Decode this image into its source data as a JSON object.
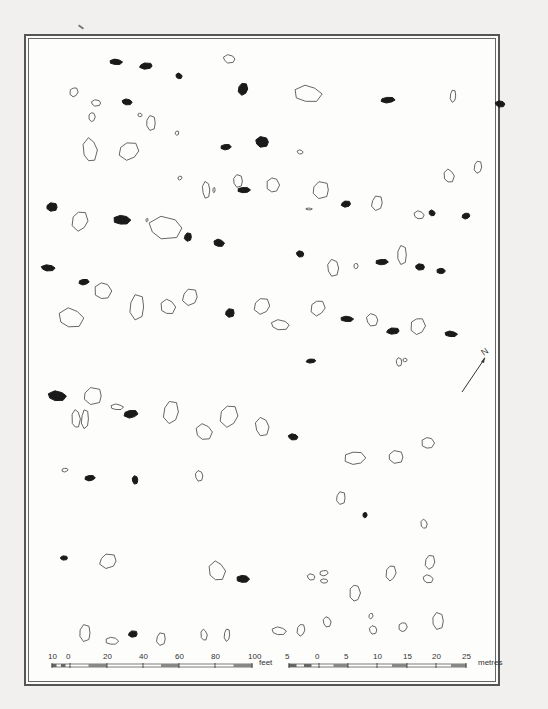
{
  "figure": {
    "type": "archaeological site plan (stone rows)",
    "frame": {
      "x": 24,
      "y": 34,
      "width": 476,
      "height": 652
    },
    "north_arrow": {
      "label": "N",
      "from": [
        462,
        392
      ],
      "to": [
        485,
        358
      ]
    },
    "legend_semantics": {
      "outline-stone": "standing/visible stone (outlined)",
      "filled-stone": "fallen or buried stone (solid black)"
    }
  },
  "scale_feet": {
    "unit_label": "feet",
    "tick_labels": [
      "10",
      "0",
      "20",
      "40",
      "60",
      "80",
      "100"
    ],
    "tick_x": [
      52,
      70,
      107,
      143,
      179,
      215,
      252
    ]
  },
  "scale_metres": {
    "unit_label": "metres",
    "tick_labels": [
      "5",
      "0",
      "5",
      "10",
      "15",
      "20",
      "25"
    ],
    "tick_x": [
      289,
      319,
      348,
      377,
      407,
      436,
      466
    ]
  },
  "colors": {
    "paper": "#fdfdfc",
    "frame": "#555555",
    "ink": "#1a1a1a",
    "outline": "#555555"
  },
  "stones_filled": [
    [
      116,
      62,
      6,
      3
    ],
    [
      146,
      66,
      7,
      3
    ],
    [
      179,
      76,
      3,
      3
    ],
    [
      243,
      89,
      5,
      6
    ],
    [
      127,
      102,
      5,
      3
    ],
    [
      388,
      100,
      7,
      3
    ],
    [
      500,
      104,
      5,
      3
    ],
    [
      226,
      147,
      5,
      3
    ],
    [
      262,
      142,
      7,
      5
    ],
    [
      244,
      190,
      6,
      3
    ],
    [
      52,
      207,
      6,
      4
    ],
    [
      122,
      220,
      8,
      5
    ],
    [
      188,
      237,
      4,
      4
    ],
    [
      219,
      243,
      5,
      4
    ],
    [
      346,
      204,
      5,
      3
    ],
    [
      432,
      213,
      3,
      3
    ],
    [
      466,
      216,
      4,
      3
    ],
    [
      48,
      268,
      7,
      3
    ],
    [
      84,
      282,
      5,
      3
    ],
    [
      300,
      254,
      4,
      3
    ],
    [
      382,
      262,
      6,
      3
    ],
    [
      420,
      267,
      5,
      3
    ],
    [
      441,
      271,
      4,
      3
    ],
    [
      230,
      313,
      5,
      4
    ],
    [
      347,
      319,
      6,
      3
    ],
    [
      393,
      331,
      7,
      3
    ],
    [
      451,
      334,
      6,
      3
    ],
    [
      311,
      361,
      5,
      2
    ],
    [
      57,
      396,
      9,
      5
    ],
    [
      131,
      414,
      7,
      4
    ],
    [
      293,
      437,
      5,
      3
    ],
    [
      90,
      478,
      5,
      3
    ],
    [
      135,
      480,
      3,
      4
    ],
    [
      365,
      515,
      2,
      3
    ],
    [
      64,
      558,
      4,
      2
    ],
    [
      243,
      579,
      6,
      4
    ],
    [
      133,
      634,
      5,
      3
    ]
  ],
  "stones_outline": [
    [
      229,
      59,
      6,
      4
    ],
    [
      74,
      92,
      4,
      5
    ],
    [
      96,
      103,
      5,
      3
    ],
    [
      92,
      117,
      3,
      5
    ],
    [
      151,
      123,
      5,
      7
    ],
    [
      140,
      115,
      2,
      2
    ],
    [
      177,
      133,
      2,
      2
    ],
    [
      308,
      94,
      13,
      9
    ],
    [
      453,
      96,
      3,
      6
    ],
    [
      90,
      150,
      7,
      12
    ],
    [
      129,
      151,
      10,
      9
    ],
    [
      300,
      152,
      3,
      2
    ],
    [
      180,
      178,
      2,
      2
    ],
    [
      206,
      190,
      4,
      8
    ],
    [
      214,
      190,
      1,
      3
    ],
    [
      238,
      181,
      5,
      6
    ],
    [
      273,
      185,
      6,
      8
    ],
    [
      321,
      190,
      9,
      8
    ],
    [
      309,
      209,
      3,
      1
    ],
    [
      377,
      203,
      6,
      7
    ],
    [
      449,
      176,
      5,
      7
    ],
    [
      478,
      167,
      4,
      6
    ],
    [
      419,
      215,
      5,
      4
    ],
    [
      80,
      221,
      8,
      10
    ],
    [
      165,
      228,
      17,
      11
    ],
    [
      147,
      220,
      1,
      2
    ],
    [
      333,
      268,
      6,
      8
    ],
    [
      356,
      266,
      2,
      3
    ],
    [
      402,
      255,
      5,
      9
    ],
    [
      103,
      291,
      8,
      9
    ],
    [
      137,
      307,
      8,
      12
    ],
    [
      168,
      307,
      7,
      8
    ],
    [
      190,
      297,
      8,
      8
    ],
    [
      71,
      318,
      12,
      10
    ],
    [
      262,
      306,
      8,
      8
    ],
    [
      280,
      325,
      9,
      5
    ],
    [
      318,
      308,
      7,
      8
    ],
    [
      372,
      320,
      6,
      6
    ],
    [
      418,
      326,
      7,
      9
    ],
    [
      399,
      362,
      3,
      4
    ],
    [
      405,
      360,
      2,
      2
    ],
    [
      93,
      396,
      10,
      8
    ],
    [
      76,
      419,
      4,
      10
    ],
    [
      85,
      419,
      4,
      9
    ],
    [
      117,
      407,
      6,
      3
    ],
    [
      171,
      412,
      8,
      11
    ],
    [
      204,
      432,
      8,
      8
    ],
    [
      229,
      416,
      9,
      11
    ],
    [
      262,
      427,
      7,
      9
    ],
    [
      65,
      470,
      3,
      2
    ],
    [
      199,
      476,
      4,
      5
    ],
    [
      355,
      458,
      10,
      7
    ],
    [
      396,
      457,
      8,
      6
    ],
    [
      428,
      443,
      6,
      6
    ],
    [
      341,
      498,
      5,
      6
    ],
    [
      424,
      524,
      3,
      5
    ],
    [
      108,
      561,
      9,
      7
    ],
    [
      217,
      571,
      8,
      10
    ],
    [
      430,
      562,
      5,
      7
    ],
    [
      428,
      579,
      5,
      4
    ],
    [
      391,
      573,
      5,
      8
    ],
    [
      311,
      577,
      4,
      3
    ],
    [
      324,
      573,
      4,
      3
    ],
    [
      324,
      581,
      4,
      2
    ],
    [
      355,
      593,
      5,
      9
    ],
    [
      85,
      633,
      6,
      8
    ],
    [
      112,
      641,
      6,
      4
    ],
    [
      161,
      639,
      5,
      6
    ],
    [
      204,
      635,
      3,
      6
    ],
    [
      227,
      635,
      3,
      6
    ],
    [
      279,
      631,
      7,
      4
    ],
    [
      301,
      630,
      4,
      6
    ],
    [
      327,
      622,
      4,
      5
    ],
    [
      371,
      616,
      2,
      3
    ],
    [
      373,
      630,
      4,
      4
    ],
    [
      403,
      627,
      4,
      5
    ],
    [
      438,
      621,
      6,
      8
    ]
  ]
}
